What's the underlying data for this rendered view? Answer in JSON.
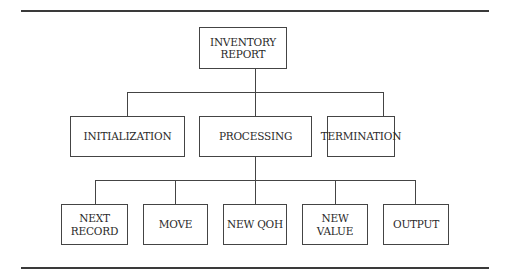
{
  "diagram": {
    "type": "hierarchy-chart",
    "root": {
      "id": "inventory-report",
      "lines": [
        "INVENTORY",
        "REPORT"
      ]
    },
    "level1": [
      {
        "id": "initialization",
        "lines": [
          "INITIALIZATION"
        ]
      },
      {
        "id": "processing",
        "lines": [
          "PROCESSING"
        ]
      },
      {
        "id": "termination",
        "lines": [
          "TERMINATION"
        ]
      }
    ],
    "level2_parent": "processing",
    "level2": [
      {
        "id": "next-record",
        "lines": [
          "NEXT",
          "RECORD"
        ]
      },
      {
        "id": "move",
        "lines": [
          "MOVE"
        ]
      },
      {
        "id": "new-qoh",
        "lines": [
          "NEW QOH"
        ]
      },
      {
        "id": "new-value",
        "lines": [
          "NEW",
          "VALUE"
        ]
      },
      {
        "id": "output",
        "lines": [
          "OUTPUT"
        ]
      }
    ],
    "colors": {
      "line": "#444444",
      "text": "#2a2a2a",
      "background": "#ffffff"
    }
  }
}
